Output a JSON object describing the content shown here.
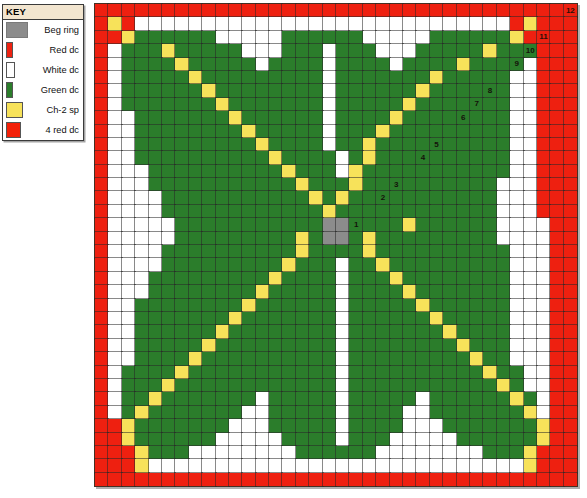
{
  "key": {
    "title": "KEY",
    "items": [
      {
        "swatch": "beg-ring-swatch",
        "label": "Beg ring",
        "color": "#8c8c8c"
      },
      {
        "swatch": "red-dc-swatch",
        "label": "Red dc",
        "color": "#ee2211"
      },
      {
        "swatch": "white-dc-swatch",
        "label": "White dc",
        "color": "#ffffff"
      },
      {
        "swatch": "green-dc-swatch",
        "label": "Green dc",
        "color": "#2b7d2b"
      },
      {
        "swatch": "ch2-sp-swatch",
        "label": "Ch-2 sp",
        "color": "#f7e25a"
      },
      {
        "swatch": "four-red-dc-swatch",
        "label": "4 red dc",
        "color": "#f32008"
      }
    ]
  },
  "caption": {
    "text": ""
  },
  "chart_data": {
    "type": "heatmap",
    "title": "",
    "xlabel": "",
    "ylabel": "",
    "grid": true,
    "legend_position": "left",
    "cols": 36,
    "rows": 36,
    "cell_px": 13.4,
    "palette": {
      "R": "#ee2010",
      "W": "#ffffff",
      "G": "#2b7d2b",
      "Y": "#f7e25a",
      "B": "#8c8c8c"
    },
    "palette_names": {
      "R": "Red dc",
      "W": "White dc",
      "G": "Green dc",
      "Y": "Ch-2 sp",
      "B": "Beg ring"
    },
    "round_numbers": [
      1,
      2,
      3,
      4,
      5,
      6,
      7,
      8,
      9,
      10,
      11,
      12
    ],
    "number_cells": [
      {
        "label": "1",
        "row": 16,
        "col": 19
      },
      {
        "label": "2",
        "row": 14,
        "col": 21
      },
      {
        "label": "3",
        "row": 13,
        "col": 22
      },
      {
        "label": "4",
        "row": 11,
        "col": 24
      },
      {
        "label": "5",
        "row": 10,
        "col": 25
      },
      {
        "label": "6",
        "row": 8,
        "col": 27
      },
      {
        "label": "7",
        "row": 7,
        "col": 28
      },
      {
        "label": "8",
        "row": 6,
        "col": 29
      },
      {
        "label": "9",
        "row": 4,
        "col": 31
      },
      {
        "label": "10",
        "row": 3,
        "col": 32
      },
      {
        "label": "11",
        "row": 2,
        "col": 33
      },
      {
        "label": "12",
        "row": 0,
        "col": 35
      }
    ],
    "rows_data": [
      "RRRRRRRRRRRRRRRRRRRRRRRRRRRRRRRRRRRR",
      "RYRWWWWWWWWWWWWWWWWWWWWWWWWWWWWRYRRR",
      "RRYGGGGGGWWWWWGGGGGGWWWWWGGGGGGYRRRR",
      "RWGGGYGGGGGWWWGGGWGGGWWWGGGGGYGGGRRR",
      "RWGGGGYGGGGGWGGGGWGGGGWGGGGYGGGGWRRR",
      "RWGGGGGYGGGGGGGGGWGGGGGGGYGGGGGWWRRR",
      "RWGGGGGGYGGGGGGGGWGGGGGGYGGGGGGWWRRR",
      "RWGGGGGGGYGGGGGGGWGGGGGYGGGGGGGWWRRR",
      "RWWGGGGGGGYGGGGGGWGGGGYGGGGGGGGWWRRR",
      "RWWGGGGGGGGYGGGGGWGGGYGGGGGGGGGWWRRR",
      "RWWGGGGGGGGGYGGGGWGGYGGGGGGGGGGWWRRR",
      "RWWGGGGGGGGGGYGGGGWGYGGGGGGGGGGWWRRR",
      "RWWWGGGGGGGGGGYGGGWYGGGGGGGGGGGWWRRR",
      "RWWWGGGGGGGGGGGYGGGYGGGGGGGGGGWWWRRR",
      "RWWWWGGGGGGGGGGGYGYGGGGGGGGGGGWWWRRR",
      "RWWWWGGGGGGGGGGGGYGGGGGGGGGGGGWWWRRR",
      "RWWWWWGGGGGGGGGGGBBGGGGYGGGGGGWWWWRR",
      "RWWWWWGGGGGGGGGYGBBGYGGGGGGGGGWWWWRR",
      "RWWWWGGGGGGGGGGYGGGGYGGGGGGGGGGWWWRR",
      "RWWWWGGGGGGGGGYGGGWGGYGGGGGGGGGWWWRR",
      "RWWWGGGGGGGGGYGGGGWGGGYGGGGGGGGWWWRR",
      "RWWWGGGGGGGGYGGGGGWGGGGYGGGGGGGWWWRR",
      "RWWGGGGGGGGYGGGGGGWGGGGGYGGGGGGWWWRR",
      "RWWGGGGGGGYGGGGGGGWGGGGGGYGGGGGWWWRR",
      "RWWGGGGGGYGGGGGGGGWGGGGGGGYGGGGWWWRR",
      "RWWGGGGGYGGGGGGGGGWGGGGGGGGYGGGWWWRR",
      "RWWGGGGYGGGGGGGGGGWGGGGGGGGGYGGWWWRR",
      "RWGGGGYGGGGGGGGGGGWGGGGGGGGGGYGGWWRR",
      "RWGGGYGGGGGGGGGGGGWGGGGGGGGGGGYGWWRR",
      "RWGGYGGGGGGGWGGGGGWGGGGGWGGGGGGYGWRR",
      "RWGYGGGGGGGWWGGGGGWGGGGWWGGGGGGGYWRR",
      "RRYGGGGGGGWWWGGGGGWGGGGWWWGGGGGGGYRR",
      "RRYGGGGGGWWWWWGGGGWGGGWWWWWGGGGGGYRR",
      "RRRYGGGWWWWWWWWGGGGGGWWWWWWWWGGGYRRR",
      "RRRYWWWWWWWWWWWWWWWWWWWWWWWWWWWWYRRR",
      "RRRRRRRRRRRRRRRRRRRRRRRRRRRRRRRRRRRR"
    ]
  }
}
